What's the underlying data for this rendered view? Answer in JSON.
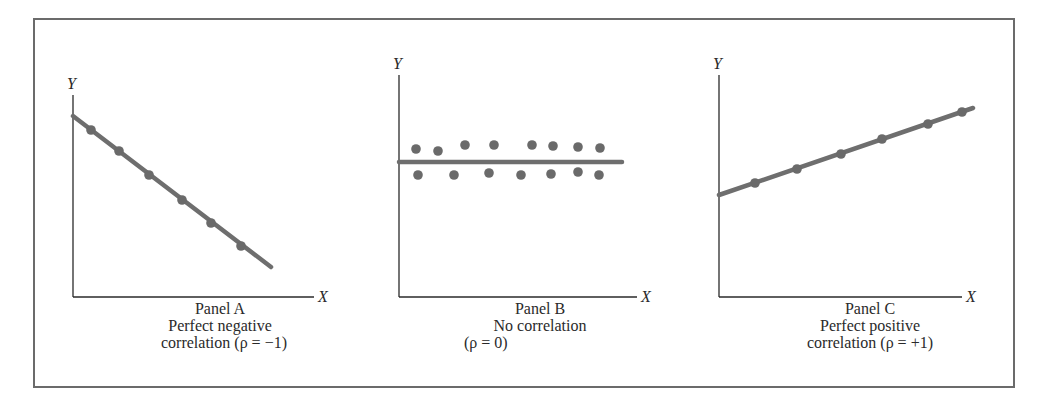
{
  "colors": {
    "line": "#6e6e6e",
    "dot": "#6a6a6a",
    "axis": "#2a2a2a",
    "frame": "#6b6b6b"
  },
  "chart_data": [
    {
      "type": "scatter",
      "panel": "A",
      "title": "Panel A",
      "subtitle": [
        "Perfect negative",
        "correlation (ρ = −1)"
      ],
      "xlabel": "X",
      "ylabel": "Y",
      "grid": false,
      "points": [
        {
          "x": 1,
          "y": 9.2
        },
        {
          "x": 2,
          "y": 8.2
        },
        {
          "x": 3,
          "y": 7.1
        },
        {
          "x": 4,
          "y": 6.0
        },
        {
          "x": 5,
          "y": 4.9
        },
        {
          "x": 6,
          "y": 3.9
        }
      ],
      "fit_line": {
        "slope": -1,
        "label": "ρ = −1"
      }
    },
    {
      "type": "scatter",
      "panel": "B",
      "title": "Panel B",
      "subtitle": [
        "No correlation",
        "(ρ = 0)"
      ],
      "xlabel": "X",
      "ylabel": "Y",
      "grid": false,
      "points": [
        {
          "x": 1,
          "y": 6.6
        },
        {
          "x": 1.2,
          "y": 5.6
        },
        {
          "x": 2,
          "y": 6.5
        },
        {
          "x": 2.4,
          "y": 5.6
        },
        {
          "x": 3,
          "y": 6.7
        },
        {
          "x": 3.6,
          "y": 5.7
        },
        {
          "x": 4,
          "y": 6.7
        },
        {
          "x": 4.8,
          "y": 5.6
        },
        {
          "x": 5.2,
          "y": 6.7
        },
        {
          "x": 5.8,
          "y": 5.6
        },
        {
          "x": 6,
          "y": 6.7
        },
        {
          "x": 6.7,
          "y": 5.7
        },
        {
          "x": 7,
          "y": 6.6
        },
        {
          "x": 7.5,
          "y": 5.6
        },
        {
          "x": 7.8,
          "y": 6.6
        }
      ],
      "fit_line": {
        "slope": 0,
        "label": "ρ = 0"
      }
    },
    {
      "type": "scatter",
      "panel": "C",
      "title": "Panel C",
      "subtitle": [
        "Perfect positive",
        "correlation (ρ = +1)"
      ],
      "xlabel": "X",
      "ylabel": "Y",
      "grid": false,
      "points": [
        {
          "x": 1,
          "y": 5.6
        },
        {
          "x": 2,
          "y": 6.1
        },
        {
          "x": 3,
          "y": 6.6
        },
        {
          "x": 4,
          "y": 7.1
        },
        {
          "x": 5,
          "y": 7.6
        },
        {
          "x": 6,
          "y": 8.0
        }
      ],
      "fit_line": {
        "slope": 1,
        "label": "ρ = +1"
      }
    }
  ],
  "panels": {
    "a": {
      "y_label": "Y",
      "x_label": "X",
      "title": "Panel A",
      "line1": "Perfect negative",
      "line2": "correlation (ρ = −1)",
      "geom": {
        "origin": [
          73,
          297
        ],
        "y_top": 95,
        "x_right": 314,
        "line": [
          73,
          116,
          271,
          267
        ],
        "dots": [
          [
            91,
            130
          ],
          [
            119,
            151
          ],
          [
            149,
            175
          ],
          [
            182,
            200
          ],
          [
            211,
            223
          ],
          [
            241,
            246
          ]
        ]
      }
    },
    "b": {
      "y_label": "Y",
      "x_label": "X",
      "title": "Panel B",
      "line1": "No correlation",
      "line2": "(ρ = 0)",
      "geom": {
        "origin": [
          399,
          297
        ],
        "y_top": 75,
        "x_right": 637,
        "line": [
          399,
          162,
          622,
          162
        ],
        "dots": [
          [
            416,
            149
          ],
          [
            418,
            175
          ],
          [
            438,
            151
          ],
          [
            454,
            175
          ],
          [
            465,
            145
          ],
          [
            489,
            173
          ],
          [
            494,
            145
          ],
          [
            521,
            175
          ],
          [
            532,
            145
          ],
          [
            551,
            174
          ],
          [
            553,
            146
          ],
          [
            578,
            172
          ],
          [
            578,
            147
          ],
          [
            599,
            175
          ],
          [
            600,
            148
          ]
        ]
      }
    },
    "c": {
      "y_label": "Y",
      "x_label": "X",
      "title": "Panel C",
      "line1": "Perfect positive",
      "line2": "correlation (ρ = +1)",
      "geom": {
        "origin": [
          719,
          297
        ],
        "y_top": 75,
        "x_right": 962,
        "line": [
          719,
          195,
          973,
          108
        ],
        "dots": [
          [
            755,
            183
          ],
          [
            797,
            169
          ],
          [
            841,
            154
          ],
          [
            882,
            139
          ],
          [
            928,
            124
          ],
          [
            962,
            112
          ]
        ]
      }
    }
  }
}
